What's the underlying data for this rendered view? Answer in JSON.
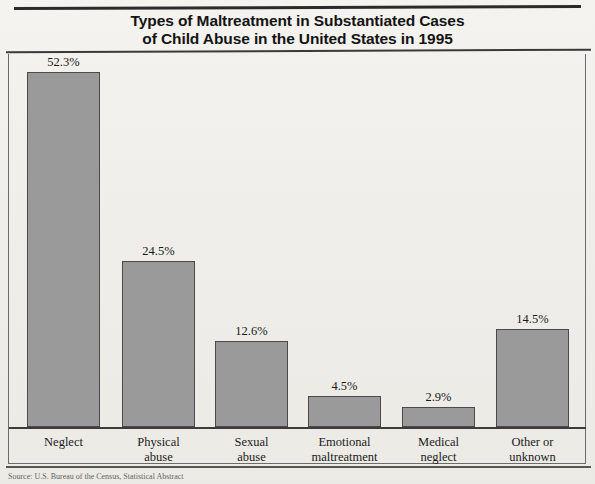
{
  "chart_data": {
    "type": "bar",
    "title": "Types of Maltreatment in Substantiated Cases of Child Abuse in the United States in 1995",
    "title_line1": "Types of Maltreatment in Substantiated Cases",
    "title_line2": "of Child Abuse in the United States in 1995",
    "xlabel": "",
    "ylabel": "",
    "ylim": [
      0,
      55
    ],
    "grid": false,
    "legend": "none",
    "value_label_suffix": "%",
    "bar_color": "#9a9a9a",
    "bar_border_color": "#4a4a4a",
    "background_color": "#f2f1ed",
    "categories": [
      "Neglect",
      "Physical abuse",
      "Sexual abuse",
      "Emotional maltreatment",
      "Medical neglect",
      "Other or unknown"
    ],
    "values": [
      52.3,
      24.5,
      12.6,
      4.5,
      2.9,
      14.5
    ],
    "value_labels": [
      "52.3%",
      "24.5%",
      "12.6%",
      "4.5%",
      "2.9%",
      "14.5%"
    ],
    "bars": [
      {
        "category": "Neglect",
        "label_line1": "Neglect",
        "label_line2": "",
        "value": 52.3,
        "value_label": "52.3%"
      },
      {
        "category": "Physical abuse",
        "label_line1": "Physical",
        "label_line2": "abuse",
        "value": 24.5,
        "value_label": "24.5%"
      },
      {
        "category": "Sexual abuse",
        "label_line1": "Sexual",
        "label_line2": "abuse",
        "value": 12.6,
        "value_label": "12.6%"
      },
      {
        "category": "Emotional maltreatment",
        "label_line1": "Emotional",
        "label_line2": "maltreatment",
        "value": 4.5,
        "value_label": "4.5%"
      },
      {
        "category": "Medical neglect",
        "label_line1": "Medical",
        "label_line2": "neglect",
        "value": 2.9,
        "value_label": "2.9%"
      },
      {
        "category": "Other or unknown",
        "label_line1": "Other or",
        "label_line2": "unknown",
        "value": 14.5,
        "value_label": "14.5%"
      }
    ]
  },
  "source": {
    "text": "Source: U.S. Bureau of the Census, Statistical Abstract"
  }
}
